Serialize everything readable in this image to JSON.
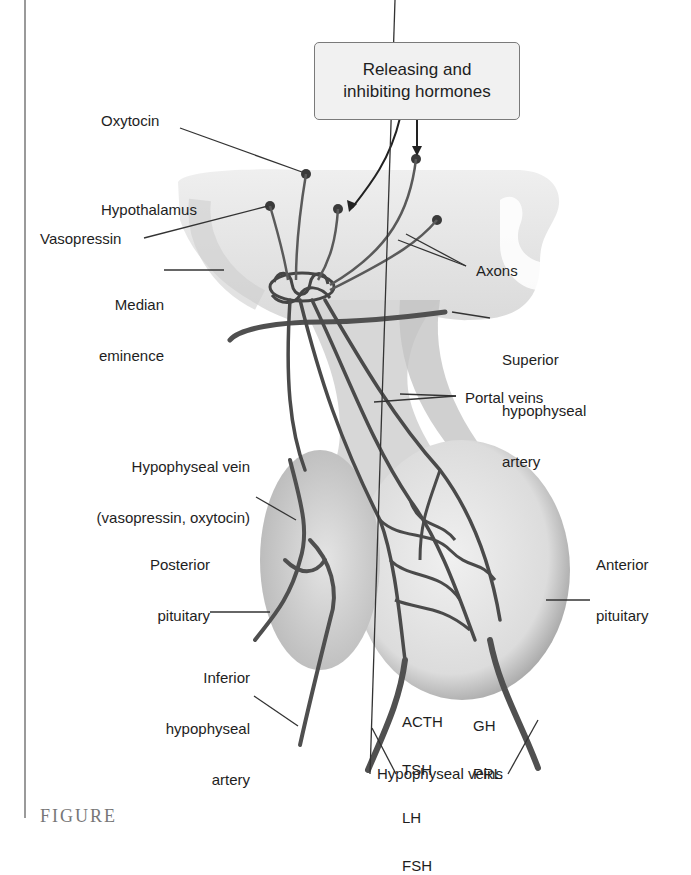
{
  "figure": {
    "callout_box": {
      "line1": "Releasing and",
      "line2": "inhibiting hormones"
    },
    "labels": {
      "oxytocin": "Oxytocin",
      "hypothalamus": "Hypothalamus",
      "vasopressin": "Vasopressin",
      "median_eminence_1": "Median",
      "median_eminence_2": "eminence",
      "axons": "Axons",
      "superior_1": "Superior",
      "superior_2": "hypophyseal",
      "superior_3": "artery",
      "portal_veins": "Portal veins",
      "hypophyseal_vein_1": "Hypophyseal vein",
      "hypophyseal_vein_2": "(vasopressin, oxytocin)",
      "posterior_1": "Posterior",
      "posterior_2": "pituitary",
      "anterior_1": "Anterior",
      "anterior_2": "pituitary",
      "inferior_1": "Inferior",
      "inferior_2": "hypophyseal",
      "inferior_3": "artery",
      "hormones_left": [
        "ACTH",
        "TSH",
        "LH",
        "FSH"
      ],
      "hormones_right": [
        "GH",
        "PRL"
      ],
      "hypophyseal_veins": "Hypophyseal veins"
    },
    "caption_partial": "FIGURE"
  },
  "colors": {
    "tissue_light": "#e6e6e6",
    "tissue_mid": "#c9c9c9",
    "tissue_dark": "#a9a9a9",
    "vessel": "#4a4a4a",
    "neuron": "#3a3a3a",
    "leader_line": "#333333"
  }
}
